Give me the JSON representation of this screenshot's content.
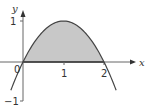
{
  "chart_data": {
    "type": "area",
    "title": "",
    "function": "y = 2x - x^2",
    "xlabel": "x",
    "ylabel": "y",
    "x_ticks": [
      {
        "value": 0,
        "label": "0"
      },
      {
        "value": 1,
        "label": "1"
      },
      {
        "value": 2,
        "label": "2"
      }
    ],
    "y_ticks": [
      {
        "value": 1,
        "label": "1"
      },
      {
        "value": -1,
        "label": "-1"
      }
    ],
    "xlim": [
      -0.55,
      2.8
    ],
    "ylim": [
      -1.0,
      1.3
    ],
    "grid": false,
    "legend": null,
    "curve": {
      "x": [
        -0.3,
        -0.2,
        -0.1,
        0,
        0.25,
        0.5,
        0.75,
        1,
        1.25,
        1.5,
        1.75,
        2,
        2.1,
        2.2,
        2.3
      ],
      "y": [
        -0.69,
        -0.44,
        -0.21,
        0,
        0.4375,
        0.75,
        0.9375,
        1,
        0.9375,
        0.75,
        0.4375,
        0,
        -0.21,
        -0.44,
        -0.69
      ]
    },
    "shaded_region": {
      "from_x": 0,
      "to_x": 2,
      "between": "curve and x-axis",
      "color": "#c8c8c8"
    },
    "colors": {
      "axis": "#555555",
      "curve": "#444444",
      "fill": "#c8c8c8",
      "baseline": "#333333"
    }
  },
  "labels": {
    "y_axis": "y",
    "x_axis": "x",
    "origin": "0",
    "tick_x1": "1",
    "tick_x2": "2",
    "tick_y1": "1",
    "tick_yneg1": "−1"
  }
}
